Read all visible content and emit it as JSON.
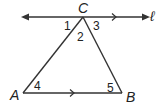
{
  "figure": {
    "line_label": "ℓ",
    "points": {
      "A": {
        "label": "A",
        "x": 23,
        "y": 93
      },
      "B": {
        "label": "B",
        "x": 122,
        "y": 93
      },
      "C": {
        "label": "C",
        "x": 83,
        "y": 17
      }
    },
    "angles": [
      {
        "label": "1",
        "x": 68,
        "y": 30
      },
      {
        "label": "2",
        "x": 80,
        "y": 40
      },
      {
        "label": "3",
        "x": 96,
        "y": 30
      },
      {
        "label": "4",
        "x": 36,
        "y": 90
      },
      {
        "label": "5",
        "x": 108,
        "y": 92
      }
    ],
    "stroke_color": "#333333"
  }
}
